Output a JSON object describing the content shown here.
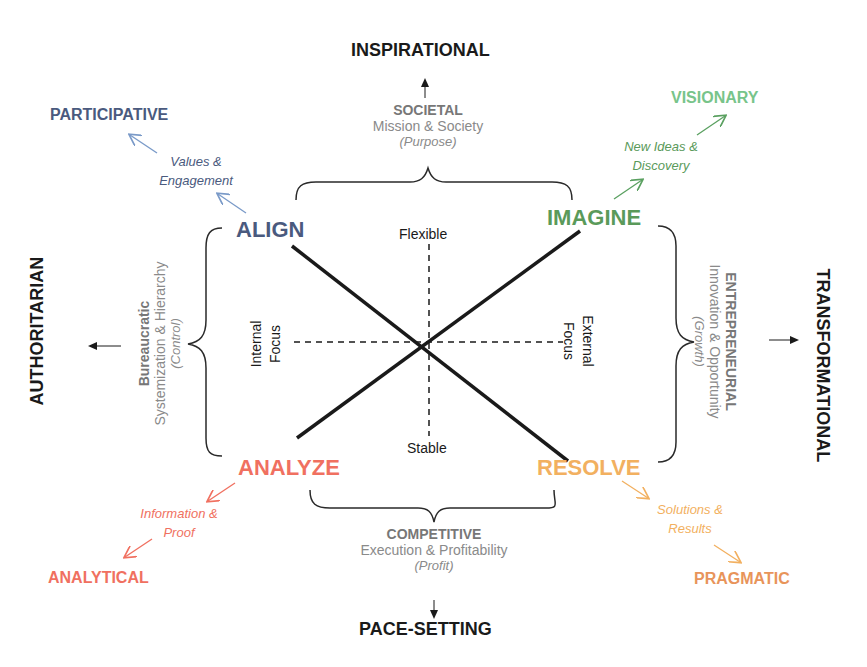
{
  "colors": {
    "align": "#4a5a7e",
    "imagine": "#5a9a5a",
    "analyze": "#f07060",
    "resolve": "#f2b060",
    "visionary": "#78c48a",
    "participative": "#4a5a7e",
    "analytical": "#f07060",
    "pragmatic": "#e8945a",
    "grey": "#8a8a8a",
    "black": "#1a1a1a"
  },
  "outer_styles": {
    "top": "INSPIRATIONAL",
    "bottom": "PACE-SETTING",
    "left": "AUTHORITARIAN",
    "right": "TRANSFORMATIONAL"
  },
  "cultures": {
    "top": {
      "title": "SOCIETAL",
      "subtitle": "Mission & Society",
      "focus": "(Purpose)"
    },
    "bottom": {
      "title": "COMPETITIVE",
      "subtitle": "Execution & Profitability",
      "focus": "(Profit)"
    },
    "left": {
      "title": "Bureaucratic",
      "subtitle": "Systemization & Hierarchy",
      "focus": "(Control)"
    },
    "right": {
      "title": "ENTREPRENEURIAL",
      "subtitle": "Innovation & Opportunity",
      "focus": "(Growth)"
    }
  },
  "quadrants": {
    "align": {
      "label": "ALIGN",
      "value_line1": "Values &",
      "value_line2": "Engagement",
      "style": "PARTICIPATIVE"
    },
    "imagine": {
      "label": "IMAGINE",
      "value_line1": "New Ideas &",
      "value_line2": "Discovery",
      "style": "VISIONARY"
    },
    "analyze": {
      "label": "ANALYZE",
      "value_line1": "Information &",
      "value_line2": "Proof",
      "style": "ANALYTICAL"
    },
    "resolve": {
      "label": "RESOLVE",
      "value_line1": "Solutions &",
      "value_line2": "Results",
      "style": "PRAGMATIC"
    }
  },
  "axes": {
    "top": "Flexible",
    "bottom": "Stable",
    "left_line1": "Internal",
    "left_line2": "Focus",
    "right_line1": "External",
    "right_line2": "Focus"
  }
}
